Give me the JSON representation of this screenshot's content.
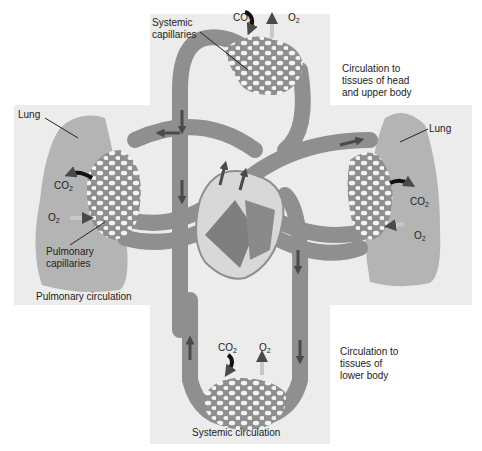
{
  "diagram": {
    "type": "circulatory-system",
    "labels": {
      "systemic_capillaries": [
        "Systemic",
        "capillaries"
      ],
      "top_co2": "CO",
      "top_o2": "O",
      "head_circulation": [
        "Circulation to",
        "tissues of head",
        "and upper body"
      ],
      "left_lung": "Lung",
      "right_lung": "Lung",
      "left_co2": "CO",
      "left_o2": "O",
      "right_co2": "CO",
      "right_o2": "O",
      "pulmonary_capillaries": [
        "Pulmonary",
        "capillaries"
      ],
      "pulmonary_circulation": "Pulmonary circulation",
      "bottom_co2": "CO",
      "bottom_o2": "O",
      "lower_circulation": [
        "Circulation to",
        "tissues of",
        "lower body"
      ],
      "systemic_circulation": "Systemic circulation",
      "subscript": "2"
    },
    "colors": {
      "background": "#ffffff",
      "panel": "#ececec",
      "vessel": "#8f8f8f",
      "vessel_dark": "#6e6e6e",
      "lung": "#b4b4b4",
      "capillary_holes": "#f4f4f4",
      "arrow": "#4a4a4a",
      "gas_arrow_dark": "#111111",
      "gas_arrow_light": "#c8c8c8"
    }
  }
}
